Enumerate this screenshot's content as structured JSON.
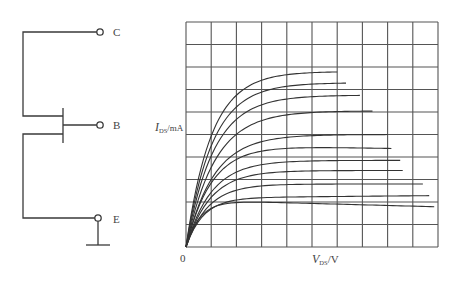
{
  "circuit": {
    "terminals": [
      {
        "id": "collector",
        "label": "C"
      },
      {
        "id": "base",
        "label": "B"
      },
      {
        "id": "emitter",
        "label": "E"
      }
    ],
    "ground": true
  },
  "chart_data": {
    "type": "line",
    "title": "",
    "xlabel": {
      "symbol": "V",
      "subscript": "DS",
      "unit": "/V"
    },
    "ylabel": {
      "symbol": "I",
      "subscript": "DS",
      "unit": "/mA"
    },
    "origin_label": "0",
    "xlim": [
      0,
      10
    ],
    "ylim": [
      0,
      10
    ],
    "grid": true,
    "grid_divisions": {
      "x": 10,
      "y": 10
    },
    "note": "Output characteristic family; axes have no numeric ticks, values given in grid units.",
    "series": [
      {
        "name": "curve-1",
        "saturation": 7.8,
        "knee": 2.2,
        "x_end": 6.0,
        "end_slope": 0.0
      },
      {
        "name": "curve-2",
        "saturation": 7.3,
        "knee": 2.3,
        "x_end": 6.35,
        "end_slope": 0.0
      },
      {
        "name": "curve-3",
        "saturation": 6.75,
        "knee": 2.4,
        "x_end": 6.9,
        "end_slope": 0.0
      },
      {
        "name": "curve-4",
        "saturation": 6.05,
        "knee": 2.5,
        "x_end": 7.4,
        "end_slope": 0.0
      },
      {
        "name": "curve-5",
        "saturation": 5.0,
        "knee": 2.4,
        "x_end": 8.0,
        "end_slope": 0.0
      },
      {
        "name": "curve-6",
        "saturation": 4.5,
        "knee": 2.2,
        "x_end": 8.15,
        "end_slope": -0.02
      },
      {
        "name": "curve-7",
        "saturation": 3.85,
        "knee": 2.2,
        "x_end": 8.5,
        "end_slope": 0.0
      },
      {
        "name": "curve-8",
        "saturation": 3.4,
        "knee": 2.1,
        "x_end": 8.6,
        "end_slope": 0.0
      },
      {
        "name": "curve-9",
        "saturation": 2.8,
        "knee": 1.9,
        "x_end": 9.4,
        "end_slope": 0.0
      },
      {
        "name": "curve-10",
        "saturation": 2.2,
        "knee": 1.5,
        "x_end": 9.65,
        "end_slope": 0.01
      },
      {
        "name": "curve-11",
        "saturation": 2.05,
        "knee": 1.2,
        "x_end": 9.85,
        "end_slope": -0.03
      }
    ]
  }
}
